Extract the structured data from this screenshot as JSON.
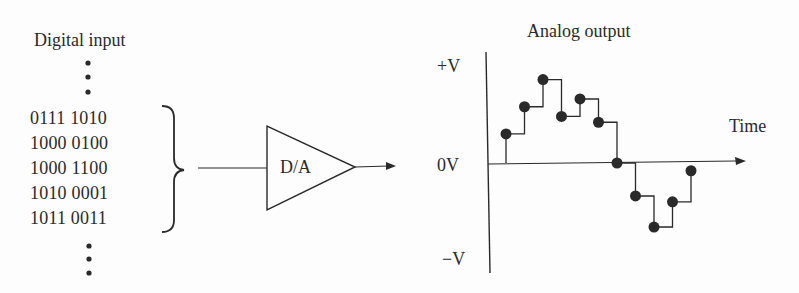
{
  "left_panel": {
    "title": "Digital input",
    "codes": [
      "0111 1010",
      "1000 0100",
      "1000 1100",
      "1010 0001",
      "1011 0011"
    ],
    "ellipsis": "continued-sequence"
  },
  "converter": {
    "label": "D/A"
  },
  "right_panel": {
    "title": "Analog output",
    "y_labels": {
      "top": "+V",
      "zero": "0V",
      "bottom": "−V"
    },
    "x_label": "Time"
  },
  "chart_data": {
    "type": "line",
    "title": "Analog output",
    "xlabel": "Time",
    "ylabel": "",
    "y_ticks": [
      "+V",
      "0V",
      "−V"
    ],
    "ylim": [
      -1,
      1
    ],
    "step": true,
    "x": [
      1,
      2,
      3,
      4,
      5,
      6,
      7,
      8,
      9,
      10,
      11
    ],
    "values": [
      0.3,
      0.58,
      0.86,
      0.48,
      0.66,
      0.42,
      0.0,
      -0.34,
      -0.66,
      -0.4,
      -0.08
    ],
    "markers": "filled-circles",
    "grid": false,
    "legend": "none"
  },
  "colors": {
    "ink": "#2a2a2a",
    "background": "#fdfdfd"
  }
}
